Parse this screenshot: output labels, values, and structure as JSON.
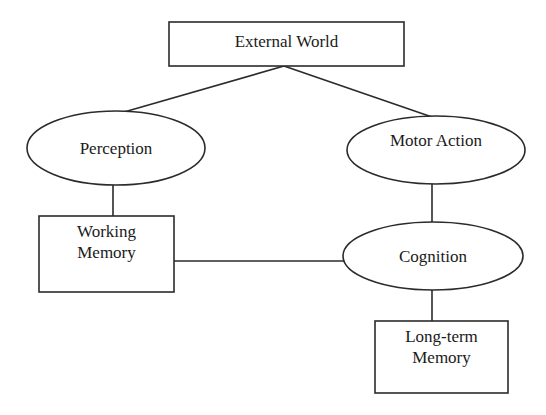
{
  "diagram": {
    "background_color": "#ffffff",
    "stroke_color": "#2b2b2b",
    "text_color": "#1a1a1a",
    "nodes": [
      {
        "id": "external-world",
        "label": "External World",
        "shape": "rectangle",
        "x": 169,
        "y": 22,
        "width": 235,
        "height": 44,
        "label_top": 31
      },
      {
        "id": "perception",
        "label": "Perception",
        "shape": "ellipse",
        "cx": 116,
        "cy": 148,
        "rx": 89,
        "ry": 37,
        "label_top": 138
      },
      {
        "id": "motor-action",
        "label": "Motor Action",
        "shape": "ellipse",
        "cx": 436,
        "cy": 150,
        "rx": 89,
        "ry": 34,
        "label_top": 130
      },
      {
        "id": "working-memory",
        "label": "Working\nMemory",
        "shape": "rectangle",
        "x": 39,
        "y": 216,
        "width": 135,
        "height": 76,
        "label_top": 221
      },
      {
        "id": "cognition",
        "label": "Cognition",
        "shape": "ellipse",
        "cx": 433,
        "cy": 256,
        "rx": 90,
        "ry": 34,
        "label_top": 246
      },
      {
        "id": "long-term-memory",
        "label": "Long-term\nMemory",
        "shape": "rectangle",
        "x": 375,
        "y": 321,
        "width": 133,
        "height": 72,
        "label_top": 326
      }
    ],
    "edges": [
      {
        "id": "external-world-to-perception",
        "from": "external-world",
        "to": "perception",
        "x1": 284,
        "y1": 66,
        "x2": 117,
        "y2": 114
      },
      {
        "id": "external-world-to-motor-action",
        "from": "external-world",
        "to": "motor-action",
        "x1": 284,
        "y1": 66,
        "x2": 432,
        "y2": 117
      },
      {
        "id": "perception-to-working-memory",
        "from": "perception",
        "to": "working-memory",
        "x1": 113,
        "y1": 185,
        "x2": 113,
        "y2": 216
      },
      {
        "id": "motor-action-to-cognition",
        "from": "motor-action",
        "to": "cognition",
        "x1": 432,
        "y1": 184,
        "x2": 432,
        "y2": 222
      },
      {
        "id": "working-memory-to-cognition",
        "from": "working-memory",
        "to": "cognition",
        "x1": 174,
        "y1": 261,
        "x2": 344,
        "y2": 261
      },
      {
        "id": "cognition-to-long-term-memory",
        "from": "cognition",
        "to": "long-term-memory",
        "x1": 432,
        "y1": 290,
        "x2": 432,
        "y2": 321
      }
    ]
  }
}
